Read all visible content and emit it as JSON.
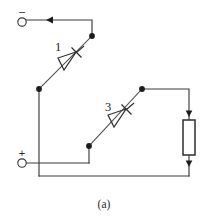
{
  "figure": {
    "caption": "(a)",
    "type": "circuit-schematic",
    "colors": {
      "background": "#ffffff",
      "wire": "#3a3a3a",
      "device": "#2e2e2e",
      "node": "#1c1c1c",
      "text": "#2b2b2b"
    }
  },
  "terminals": [
    {
      "id": "negative",
      "sign": "–",
      "name": "negative-terminal",
      "circle": {
        "cx": 22,
        "cy": 22,
        "r": 4.2
      },
      "sign_pos": {
        "x": 18.5,
        "y": 13
      }
    },
    {
      "id": "positive",
      "sign": "+",
      "name": "positive-terminal",
      "circle": {
        "cx": 22,
        "cy": 163,
        "r": 4.2
      },
      "sign_pos": {
        "x": 18.0,
        "y": 156
      }
    }
  ],
  "devices": [
    {
      "id": "thyristor-1",
      "label": "1",
      "kind": "thyristor",
      "label_pos": {
        "x": 58,
        "y": 51
      },
      "anode": {
        "x": 92,
        "y": 36
      },
      "cathode": {
        "x": 39,
        "y": 89
      }
    },
    {
      "id": "thyristor-3",
      "label": "3",
      "kind": "thyristor",
      "label_pos": {
        "x": 108,
        "y": 111
      },
      "anode": {
        "x": 142,
        "y": 89
      },
      "cathode": {
        "x": 89,
        "y": 146
      }
    }
  ],
  "load": {
    "id": "load-resistor",
    "name": "load-resistor",
    "shape": "rectangle",
    "box": {
      "x": 183,
      "y": 120,
      "width": 12,
      "height": 35
    }
  },
  "nodes": [
    {
      "id": "node-top-right",
      "x": 92,
      "y": 36
    },
    {
      "id": "node-left-mid",
      "x": 39,
      "y": 89
    },
    {
      "id": "node-right-mid",
      "x": 142,
      "y": 89
    },
    {
      "id": "node-bottom-mid",
      "x": 89,
      "y": 146
    }
  ],
  "current_arrows": [
    {
      "id": "arrow-top-wire",
      "x": 50,
      "y": 20,
      "direction": "left"
    },
    {
      "id": "arrow-load-top",
      "x": 189,
      "y": 112,
      "direction": "down"
    },
    {
      "id": "arrow-load-bottom",
      "x": 189,
      "y": 163,
      "direction": "down"
    }
  ],
  "wires": {
    "top_rail": "M26,20 L92,20 L92,36",
    "left_vertical": "M39,89 L39,176",
    "positive_lead": "M26,163 L89,163",
    "bottom_mid_drop": "M89,146 L89,163",
    "right_top_rail": "M142,89 L189,89 L189,120",
    "right_bottom_drop": "M189,155 L189,176",
    "bottom_rail": "M39,176 L189,176"
  }
}
